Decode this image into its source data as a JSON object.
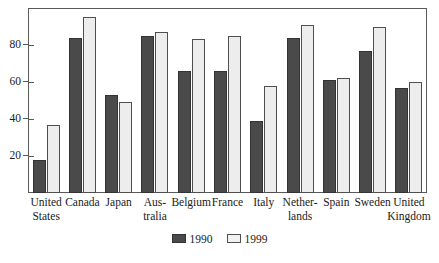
{
  "chart_data": {
    "type": "bar",
    "title": "",
    "subtitle": "",
    "xlabel": "",
    "ylabel": "",
    "ylim": [
      0,
      100
    ],
    "yticks": [
      20,
      40,
      60,
      80
    ],
    "ytick_labels": [
      "20",
      "40",
      "60",
      "80"
    ],
    "grid": false,
    "legend_position": "bottom-center",
    "categories": [
      "United\nStates",
      "Canada",
      "Japan",
      "Aus-\ntralia",
      "Belgium",
      "France",
      "Italy",
      "Nether-\nlands",
      "Spain",
      "Sweden",
      "United\nKingdom"
    ],
    "series": [
      {
        "name": "1990",
        "color": "#4a4a4a",
        "values": [
          18,
          84,
          53,
          85,
          66,
          66,
          39,
          84,
          61,
          77,
          57
        ]
      },
      {
        "name": "1999",
        "color": "#ededed",
        "values": [
          37,
          95,
          49,
          87,
          83,
          85,
          58,
          91,
          62,
          90,
          60
        ]
      }
    ]
  },
  "legend": {
    "items": [
      {
        "label": "1990",
        "swatch": "dark-swatch"
      },
      {
        "label": "1999",
        "swatch": "light-swatch"
      }
    ]
  },
  "colors": {
    "series_1990": "#4a4a4a",
    "series_1999": "#ededed",
    "axis": "#5a5a5a",
    "text": "#1a1a1a",
    "background": "#ffffff"
  }
}
